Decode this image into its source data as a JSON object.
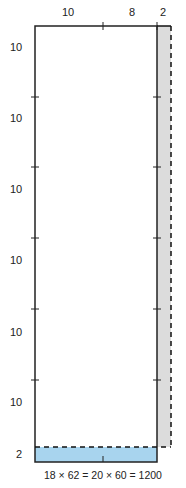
{
  "top_labels": [
    {
      "text": "10",
      "x": 69,
      "y": 6
    },
    {
      "text": "8",
      "x": 132,
      "y": 6
    },
    {
      "text": "2",
      "x": 160,
      "y": 6
    }
  ],
  "left_labels": [
    {
      "text": "10",
      "x": 11,
      "y": 41
    },
    {
      "text": "10",
      "x": 11,
      "y": 112
    },
    {
      "text": "10",
      "x": 11,
      "y": 183
    },
    {
      "text": "10",
      "x": 11,
      "y": 254
    },
    {
      "text": "10",
      "x": 11,
      "y": 326
    },
    {
      "text": "10",
      "x": 11,
      "y": 396
    },
    {
      "text": "2",
      "x": 16,
      "y": 448
    }
  ],
  "equation": "18 × 62 = 20 × 60 = 1200",
  "colors": {
    "outline": "#222222",
    "removed_strip": "#dcdcdc",
    "added_strip": "#a8d4ee",
    "dashed": "#111111"
  }
}
